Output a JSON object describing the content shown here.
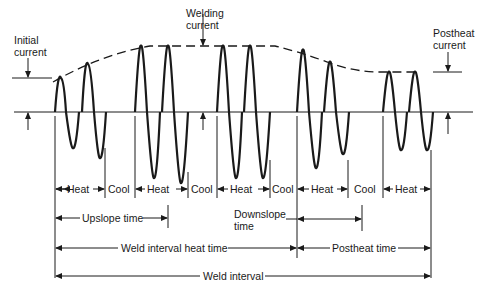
{
  "diagram": {
    "labels": {
      "initial_current": [
        "Initial",
        "current"
      ],
      "welding_current": [
        "Welding",
        "current"
      ],
      "postheat_current": [
        "Postheat",
        "current"
      ],
      "heat": "Heat",
      "cool": "Cool",
      "upslope_time": "Upslope time",
      "downslope_time": [
        "Downslope",
        "time"
      ],
      "weld_interval_heat_time": "Weld interval heat time",
      "postheat_time": "Postheat time",
      "weld_interval": "Weld interval"
    },
    "segments": [
      {
        "type": "Heat",
        "from_x": 55,
        "to_x": 105
      },
      {
        "type": "Cool",
        "from_x": 105,
        "to_x": 135
      },
      {
        "type": "Heat",
        "from_x": 135,
        "to_x": 188
      },
      {
        "type": "Cool",
        "from_x": 188,
        "to_x": 217
      },
      {
        "type": "Heat",
        "from_x": 217,
        "to_x": 270
      },
      {
        "type": "Cool",
        "from_x": 270,
        "to_x": 297
      },
      {
        "type": "Heat",
        "from_x": 297,
        "to_x": 348
      },
      {
        "type": "Cool",
        "from_x": 348,
        "to_x": 383
      },
      {
        "type": "Heat",
        "from_x": 383,
        "to_x": 431
      }
    ],
    "colors": {
      "ink": "#1a1a1a",
      "background": "#ffffff"
    }
  }
}
